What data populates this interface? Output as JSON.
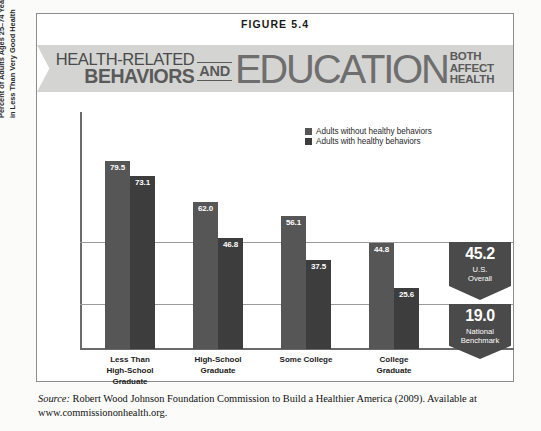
{
  "figure": {
    "label": "FIGURE 5.4"
  },
  "banner": {
    "line1": "HEALTH-RELATED",
    "line2": "BEHAVIORS",
    "conjunction": "AND",
    "subject": "EDUCATION",
    "tag_line1": "BOTH",
    "tag_line2": "AFFECT",
    "tag_line3": "HEALTH"
  },
  "legend": {
    "items": [
      {
        "label": "Adults without healthy behaviors",
        "color": "#565656"
      },
      {
        "label": "Adults with healthy behaviors",
        "color": "#3d3d3d"
      }
    ]
  },
  "callouts": [
    {
      "value": "45.2",
      "caption": "U.S.\nOverall"
    },
    {
      "value": "19.0",
      "caption": "National\nBenchmark"
    }
  ],
  "source": {
    "prefix": "Source:",
    "text": "Robert Wood Johnson Foundation Commission to Build a Healthier America (2009). Available at www.commissiononhealth.org."
  },
  "chart_data": {
    "type": "bar",
    "title": "HEALTH-RELATED BEHAVIORS AND EDUCATION BOTH AFFECT HEALTH",
    "xlabel": "",
    "ylabel": "Percent of Adults Ages 25–74 Years,\nin Less Than Very Good Health",
    "ylim": [
      0,
      100
    ],
    "grid": true,
    "gridlines": [
      45.2,
      19.0
    ],
    "legend_position": "top-right",
    "categories": [
      "Less Than\nHigh-School\nGraduate",
      "High-School\nGraduate",
      "Some College",
      "College\nGraduate"
    ],
    "series": [
      {
        "name": "Adults without healthy behaviors",
        "color": "#565656",
        "values": [
          79.5,
          62.0,
          56.1,
          44.8
        ]
      },
      {
        "name": "Adults with healthy behaviors",
        "color": "#3d3d3d",
        "values": [
          73.1,
          46.8,
          37.5,
          25.6
        ]
      }
    ],
    "reference_lines": [
      {
        "label": "U.S. Overall",
        "value": 45.2
      },
      {
        "label": "National Benchmark",
        "value": 19.0
      }
    ]
  }
}
